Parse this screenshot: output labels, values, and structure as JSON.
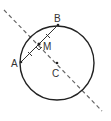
{
  "diagram": {
    "type": "geometry",
    "circle": {
      "cx": 57,
      "cy": 63,
      "r": 37,
      "stroke": "#222222"
    },
    "points": {
      "A": {
        "label": "A",
        "x": 21,
        "y": 62
      },
      "B": {
        "label": "B",
        "x": 58,
        "y": 25
      },
      "M": {
        "label": "M",
        "x": 39,
        "y": 44
      },
      "C": {
        "label": "C",
        "x": 57,
        "y": 63
      }
    },
    "dashed_line": {
      "x1": 4,
      "y1": 10,
      "x2": 102,
      "y2": 111,
      "color": "#666666"
    },
    "chord": {
      "from": "A",
      "to": "B",
      "color": "#222222"
    },
    "right_angle_marker_at": "M",
    "tick_marks": "equal-length ticks on AM and MB"
  }
}
